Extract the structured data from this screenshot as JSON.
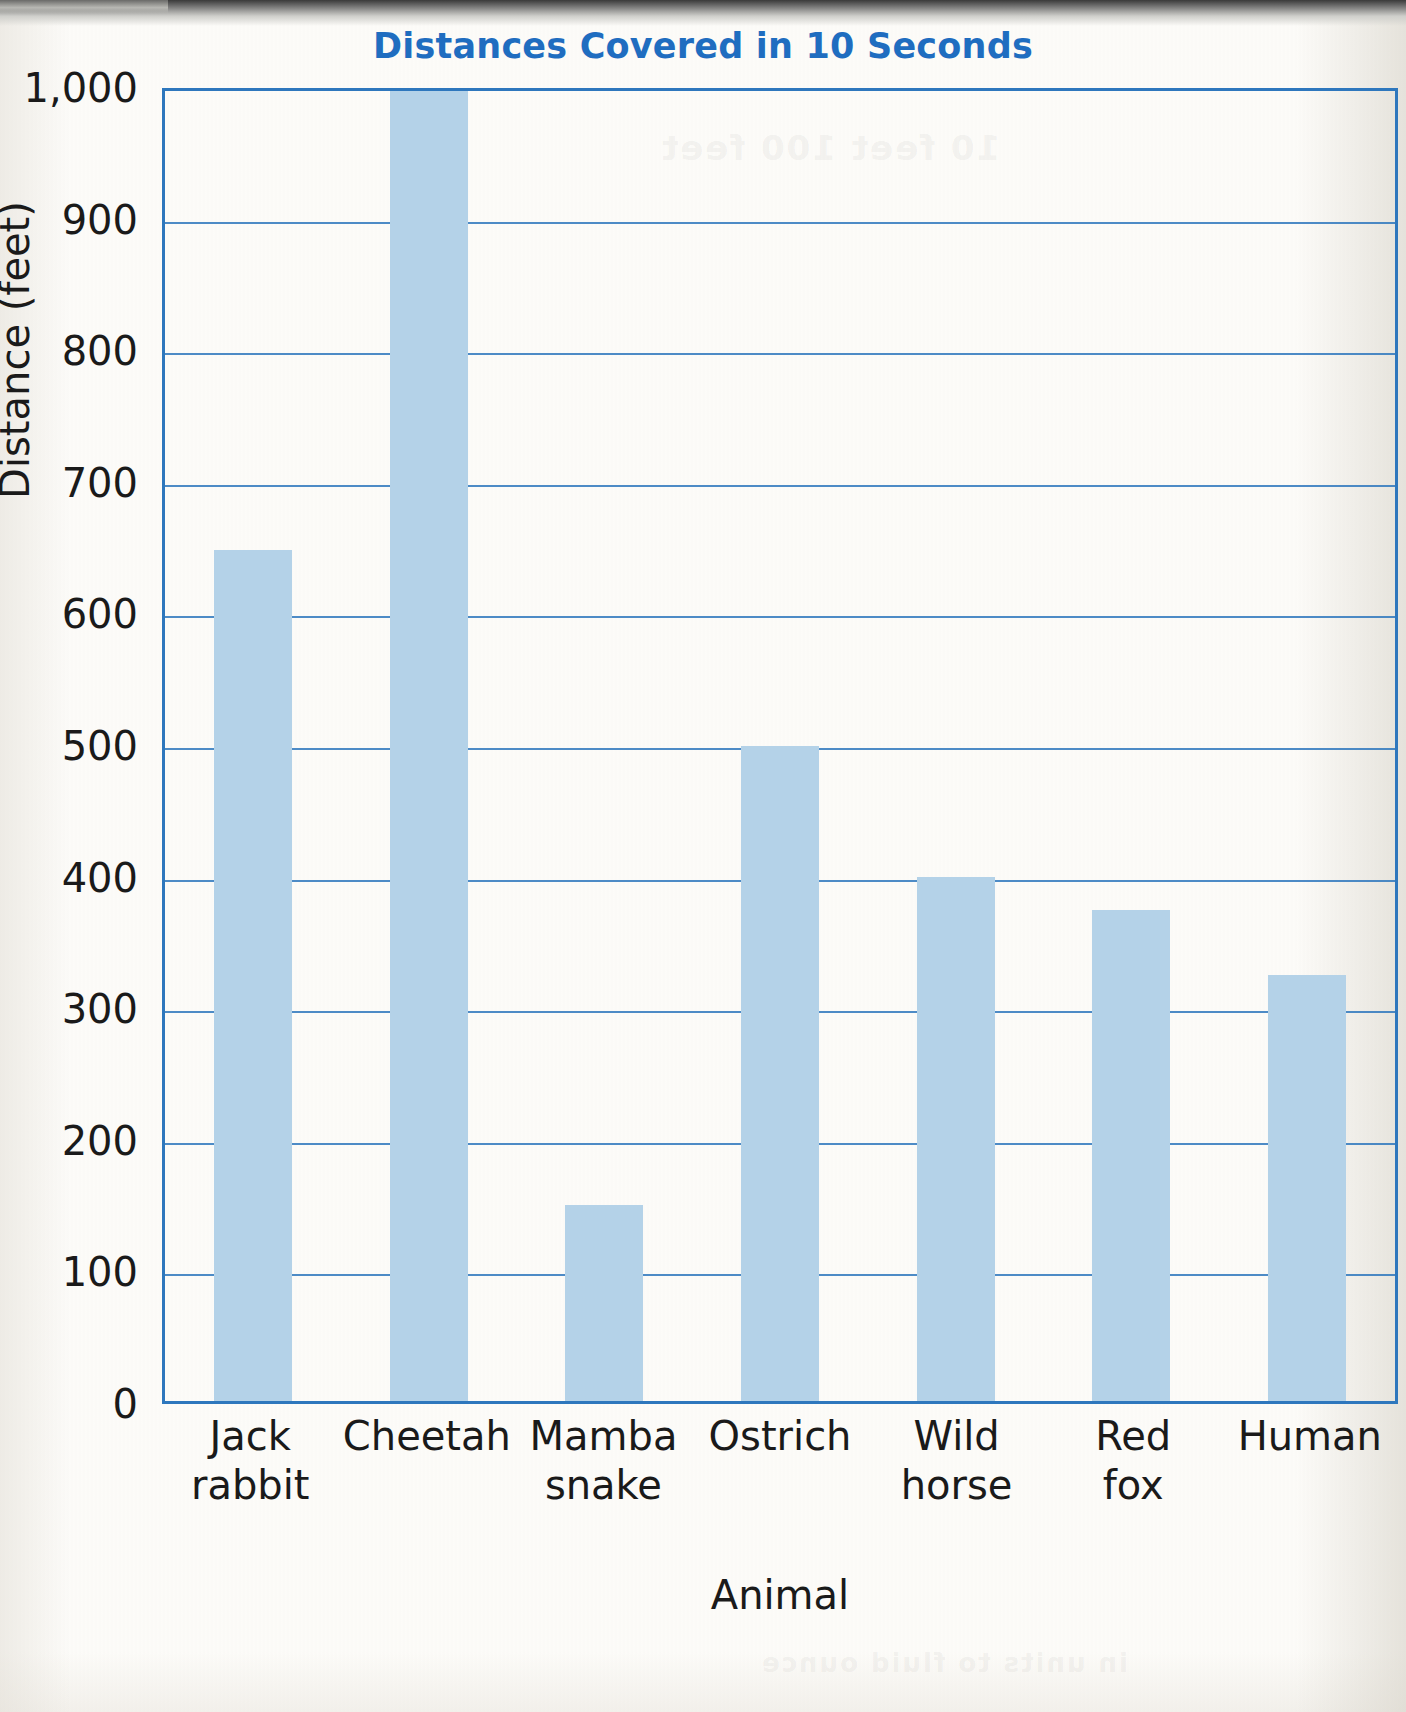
{
  "chart_data": {
    "type": "bar",
    "title": "Distances Covered in 10 Seconds",
    "xlabel": "Animal",
    "ylabel": "Distance (feet)",
    "categories": [
      "Jack rabbit",
      "Cheetah",
      "Mamba snake",
      "Ostrich",
      "Wild horse",
      "Red fox",
      "Human"
    ],
    "category_lines": [
      [
        "Jack",
        "rabbit"
      ],
      [
        "Cheetah",
        ""
      ],
      [
        "Mamba",
        "snake"
      ],
      [
        "Ostrich",
        ""
      ],
      [
        "Wild",
        "horse"
      ],
      [
        "Red",
        "fox"
      ],
      [
        "Human",
        ""
      ]
    ],
    "values": [
      650,
      1000,
      150,
      500,
      400,
      375,
      325
    ],
    "value_notes": [
      "",
      "bar reaches top of plot area (clipped at 1,000)",
      "",
      "",
      "",
      "",
      ""
    ],
    "ylim": [
      0,
      1000
    ],
    "ytick_values": [
      0,
      100,
      200,
      300,
      400,
      500,
      600,
      700,
      800,
      900,
      1000
    ],
    "ytick_labels": [
      "0",
      "100",
      "200",
      "300",
      "400",
      "500",
      "600",
      "700",
      "800",
      "900",
      "1,000"
    ],
    "grid": true,
    "grid_axis": "y",
    "legend": "none",
    "colors": {
      "bar_fill": "#b4d2e8",
      "axis_line": "#2e77bd",
      "gridline": "#2e77bd",
      "title_text": "#1f6dc0",
      "tick_text": "#1a1a1a",
      "background": "#fdfcf9"
    }
  },
  "artifacts": {
    "page_bleed_top": "10 feet  100 feet",
    "page_bleed_bottom": "in units to fluid ounce"
  }
}
